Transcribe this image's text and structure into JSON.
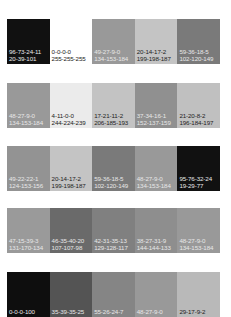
{
  "swatch_rows": [
    {
      "top": 19,
      "swatches": [
        {
          "cmyk": "96-73-24-11",
          "rgb": "20-39-101",
          "color": "#111111",
          "text": "light"
        },
        {
          "cmyk": "0-0-0-0",
          "rgb": "255-255-255",
          "color": "#ffffff",
          "text": "dark"
        },
        {
          "cmyk": "49-27-9-0",
          "rgb": "134-153-184",
          "color": "#999999",
          "text": "light"
        },
        {
          "cmyk": "20-14-17-2",
          "rgb": "199-198-187",
          "color": "#c4c4c4",
          "text": "dark"
        },
        {
          "cmyk": "59-36-18-5",
          "rgb": "102-120-149",
          "color": "#7a7a7a",
          "text": "light"
        }
      ]
    },
    {
      "top": 83,
      "swatches": [
        {
          "cmyk": "48-27-9-0",
          "rgb": "134-153-184",
          "color": "#999999",
          "text": "light"
        },
        {
          "cmyk": "4-11-0-0",
          "rgb": "244-224-239",
          "color": "#ebebeb",
          "text": "dark"
        },
        {
          "cmyk": "17-21-11-2",
          "rgb": "206-185-193",
          "color": "#c3c3c3",
          "text": "dark"
        },
        {
          "cmyk": "37-34-16-1",
          "rgb": "152-137-159",
          "color": "#909090",
          "text": "light"
        },
        {
          "cmyk": "21-20-8-2",
          "rgb": "196-184-197",
          "color": "#c0c0c0",
          "text": "dark"
        }
      ]
    },
    {
      "top": 146,
      "swatches": [
        {
          "cmyk": "49-22-22-1",
          "rgb": "124-153-156",
          "color": "#939393",
          "text": "light"
        },
        {
          "cmyk": "20-14-17-2",
          "rgb": "199-198-187",
          "color": "#c4c4c4",
          "text": "dark"
        },
        {
          "cmyk": "59-36-18-5",
          "rgb": "102-120-149",
          "color": "#7a7a7a",
          "text": "light"
        },
        {
          "cmyk": "48-27-9-0",
          "rgb": "134-153-184",
          "color": "#999999",
          "text": "light"
        },
        {
          "cmyk": "95-76-32-24",
          "rgb": "19-29-77",
          "color": "#111111",
          "text": "light"
        }
      ]
    },
    {
      "top": 208,
      "swatches": [
        {
          "cmyk": "47-15-39-3",
          "rgb": "131-170-134",
          "color": "#9a9a9a",
          "text": "light"
        },
        {
          "cmyk": "46-35-40-20",
          "rgb": "107-107-98",
          "color": "#6a6a6a",
          "text": "light"
        },
        {
          "cmyk": "42-31-35-13",
          "rgb": "129-128-117",
          "color": "#808080",
          "text": "light"
        },
        {
          "cmyk": "38-27-31-9",
          "rgb": "144-144-133",
          "color": "#8e8e8e",
          "text": "light"
        },
        {
          "cmyk": "48-27-9-0",
          "rgb": "134-153-184",
          "color": "#999999",
          "text": "light"
        }
      ]
    },
    {
      "top": 272,
      "swatches": [
        {
          "cmyk": "0-0-0-100",
          "rgb": "",
          "color": "#0e0e0e",
          "text": "light"
        },
        {
          "cmyk": "35-39-35-25",
          "rgb": "",
          "color": "#545454",
          "text": "light"
        },
        {
          "cmyk": "55-26-24-7",
          "rgb": "",
          "color": "#858585",
          "text": "light"
        },
        {
          "cmyk": "48-27-9-0",
          "rgb": "",
          "color": "#999999",
          "text": "light"
        },
        {
          "cmyk": "29-17-9-2",
          "rgb": "",
          "color": "#b9b9b9",
          "text": "dark"
        }
      ]
    }
  ]
}
